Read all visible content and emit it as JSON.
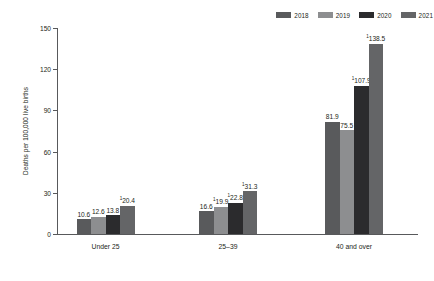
{
  "chart_data": {
    "type": "bar",
    "title": "",
    "xlabel": "",
    "ylabel": "Deaths per 100,000 live births",
    "categories": [
      "Under 25",
      "25–39",
      "40 and over"
    ],
    "ylim": [
      0,
      150
    ],
    "yticks": [
      0,
      30,
      60,
      90,
      120,
      150
    ],
    "ytick_labels": [
      "0",
      "30",
      "60",
      "90",
      "120",
      "150"
    ],
    "grid": false,
    "legend_position": "top-right",
    "series": [
      {
        "name": "2018",
        "color": "#595a5c",
        "values": [
          10.6,
          16.6,
          81.9
        ],
        "labels": [
          "10.6",
          "16.6",
          "81.9"
        ],
        "footnote_markers": [
          "",
          "",
          ""
        ]
      },
      {
        "name": "2019",
        "color": "#8d8e90",
        "values": [
          12.6,
          19.9,
          75.5
        ],
        "labels": [
          "12.6",
          "19.9",
          "75.5"
        ],
        "footnote_markers": [
          "",
          "1",
          ""
        ]
      },
      {
        "name": "2020",
        "color": "#2b2b2d",
        "values": [
          13.8,
          22.8,
          107.9
        ],
        "labels": [
          "13.8",
          "22.8",
          "107.9"
        ],
        "footnote_markers": [
          "",
          "1",
          "1"
        ]
      },
      {
        "name": "2021",
        "color": "#646567",
        "values": [
          20.4,
          31.3,
          138.5
        ],
        "labels": [
          "20.4",
          "31.3",
          "138.5"
        ],
        "footnote_markers": [
          "1",
          "1",
          "1"
        ]
      }
    ]
  },
  "legend": {
    "items": [
      {
        "label": "2018",
        "color": "#595a5c"
      },
      {
        "label": "2019",
        "color": "#8d8e90"
      },
      {
        "label": "2020",
        "color": "#2b2b2d"
      },
      {
        "label": "2021",
        "color": "#646567"
      }
    ]
  },
  "axes": {
    "y_title": "Deaths per 100,000 live births",
    "y_ticks": [
      "0",
      "30",
      "60",
      "90",
      "120",
      "150"
    ],
    "x_categories": [
      "Under 25",
      "25–39",
      "40 and over"
    ]
  },
  "colors": {
    "axis": "#58595b",
    "text": "#231f20",
    "background": "#ffffff"
  }
}
